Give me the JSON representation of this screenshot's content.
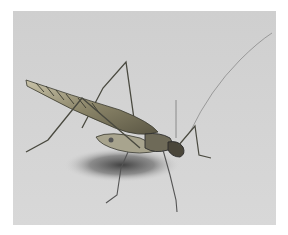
{
  "image": {
    "description": "Pencil-and-watercolor illustration of a long-legged katydid/cricket standing on a light grey background with a soft shadow beneath it",
    "subject": "katydid",
    "colors": {
      "border": "#ffffff",
      "background": "#d2d2d2",
      "shadow": "#3a3a3a",
      "wing": "#8a8468",
      "body": "#6e6a58",
      "outline": "#2e2e2e"
    }
  }
}
